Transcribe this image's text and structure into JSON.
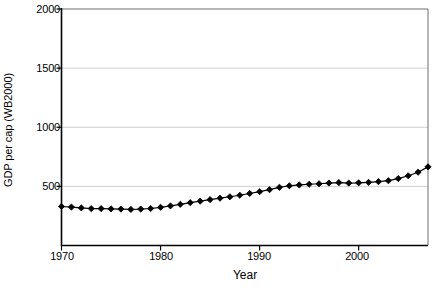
{
  "chart_data": {
    "type": "line",
    "title": "",
    "xlabel": "Year",
    "ylabel": "GDP per cap (WB2000)",
    "xlim": [
      1970,
      2007
    ],
    "ylim": [
      0,
      2000
    ],
    "xticks": [
      1970,
      1980,
      1990,
      2000
    ],
    "xtick_labels": [
      "1970",
      "1980",
      "1990",
      "2000"
    ],
    "yticks": [
      0,
      500,
      1000,
      1500,
      2000
    ],
    "ytick_labels": [
      "",
      "500",
      "1000",
      "1500",
      "2000"
    ],
    "grid": "horizontal",
    "gridlines_at": [
      500,
      1000,
      1500
    ],
    "legend": "none",
    "marker": "diamond",
    "marker_color": "#000000",
    "line_color": "#000000",
    "x": [
      1970,
      1971,
      1972,
      1973,
      1974,
      1975,
      1976,
      1977,
      1978,
      1979,
      1980,
      1981,
      1982,
      1983,
      1984,
      1985,
      1986,
      1987,
      1988,
      1989,
      1990,
      1991,
      1992,
      1993,
      1994,
      1995,
      1996,
      1997,
      1998,
      1999,
      2000,
      2001,
      2002,
      2003,
      2004,
      2005,
      2006,
      2007
    ],
    "values": [
      330,
      325,
      318,
      312,
      312,
      310,
      308,
      305,
      308,
      313,
      323,
      335,
      348,
      362,
      375,
      388,
      400,
      412,
      425,
      440,
      455,
      472,
      492,
      505,
      512,
      518,
      522,
      528,
      532,
      528,
      530,
      534,
      540,
      548,
      566,
      590,
      620,
      665
    ],
    "series_name": "GDP per cap"
  },
  "axes": {
    "ylabel_text": "GDP per cap (WB2000)",
    "xlabel_text": "Year"
  }
}
